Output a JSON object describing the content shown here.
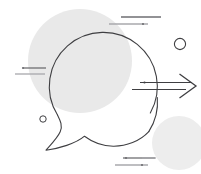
{
  "artwork": {
    "title": "Speech Bubble Communication Illustration",
    "canvas": {
      "width": 201,
      "height": 174,
      "background": "#ffffff"
    },
    "palette": {
      "stroke_dark": "#3f3f42",
      "stroke_mid": "#6e6e72",
      "stroke_light": "#a8a8ac",
      "blob_gray": "#e9e9e9",
      "blob_gray_light": "#eeeeee",
      "background": "#ffffff"
    },
    "shapes": {
      "blob_large": {
        "name": "large-gray-circle",
        "cx": 80,
        "cy": 61,
        "r": 52,
        "fill": "#e9e9e9"
      },
      "blob_small": {
        "name": "small-gray-circle",
        "cx": 179,
        "cy": 143,
        "r": 27,
        "fill": "#ededed"
      },
      "speech_bubble": {
        "name": "speech-bubble-outline",
        "cx": 104,
        "cy": 89,
        "r": 54,
        "stroke": "#3f3f42",
        "stroke_width": 1.1,
        "gap_label": "arrow-pass-through-gap"
      },
      "ring_top_right": {
        "name": "outline-ring-large",
        "cx": 180,
        "cy": 44,
        "r": 5.6,
        "stroke": "#3f3f42",
        "stroke_width": 1.1
      },
      "ring_bottom_left": {
        "name": "outline-ring-small",
        "cx": 43,
        "cy": 119,
        "r": 3.2,
        "stroke": "#3f3f42",
        "stroke_width": 1
      },
      "arrow": {
        "name": "right-arrow",
        "stroke": "#3f3f42",
        "stroke_width": 1.2,
        "tip_x": 196,
        "tip_y": 86,
        "shaft_start_x": 140,
        "dot_x": 145,
        "dot_y": 82
      }
    },
    "accent_lines": {
      "top_right_group": {
        "name": "accent-lines-top-right",
        "lines": [
          {
            "x1": 121,
            "y1": 17,
            "x2": 161,
            "y2": 17,
            "color": "#6e6e72",
            "width": 1.3
          },
          {
            "x1": 109,
            "y1": 24,
            "x2": 148,
            "y2": 24,
            "color": "#a8a8ac",
            "width": 1.3
          }
        ],
        "dots": [
          {
            "cx": 143,
            "cy": 24,
            "r": 1.1,
            "color": "#6e6e72"
          }
        ]
      },
      "left_group": {
        "name": "accent-lines-left",
        "lines": [
          {
            "x1": 23,
            "y1": 68,
            "x2": 46,
            "y2": 68,
            "color": "#6e6e72",
            "width": 1.3
          },
          {
            "x1": 15,
            "y1": 74,
            "x2": 45,
            "y2": 74,
            "color": "#a8a8ac",
            "width": 1.3
          }
        ],
        "dots": [
          {
            "cx": 23,
            "cy": 68,
            "r": 1.1,
            "color": "#6e6e72"
          }
        ]
      },
      "bottom_group": {
        "name": "accent-lines-bottom",
        "lines": [
          {
            "x1": 123,
            "y1": 158,
            "x2": 155,
            "y2": 158,
            "color": "#6e6e72",
            "width": 1.3
          },
          {
            "x1": 115,
            "y1": 165,
            "x2": 148,
            "y2": 165,
            "color": "#a8a8ac",
            "width": 1.3
          },
          {
            "x1": 142,
            "y1": 158,
            "x2": 156,
            "y2": 158,
            "color": "#a8a8ac",
            "width": 1.3
          }
        ],
        "dots": [
          {
            "cx": 126,
            "cy": 158,
            "r": 1.1,
            "color": "#6e6e72"
          },
          {
            "cx": 142,
            "cy": 165,
            "r": 1.1,
            "color": "#6e6e72"
          }
        ]
      }
    },
    "paths": {
      "bubble_arc_main": "M 150.3 113.0 A 54 54 0 1 0 57.5 115.0",
      "bubble_tail": "M 57.5 115.0 C 60.0 120.5 62.5 125.5 60.0 131.5 C 57.5 137.5 50.5 144.5 45.5 150.0 C 58.0 148.5 75.5 143.5 84.0 136.0 C 92.0 142.0 102.0 145.8 113.0 146.0 C 126.0 146.2 139.5 141.0 148.5 131.5",
      "bubble_arc_upper_right": "M 150.3 113.0 A 54 54 0 0 0 157.6 97.0",
      "bubble_gap_top": "M 157.9 79.0 A 54 54 0 0 0 152.5 62.0",
      "arrow_shaft_top": "M 140 82 L 193 82",
      "arrow_shaft_bottom": "M 133 89 L 188 89",
      "arrow_head": "M 180 74 L 196 85.5 L 180 97"
    }
  }
}
